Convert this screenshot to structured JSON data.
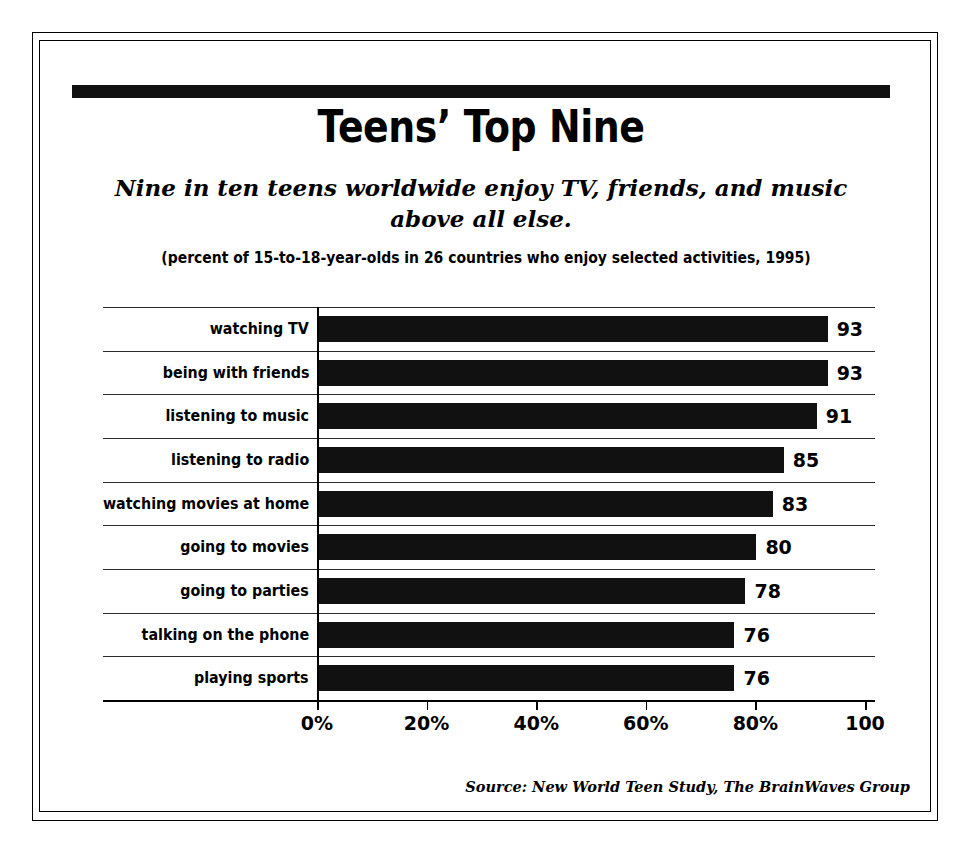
{
  "figure": {
    "title": "Teens’ Top Nine",
    "subtitle": "Nine in ten teens worldwide enjoy TV, friends, and music above all else.",
    "units_note": "(percent of 15-to-18-year-olds in 26 countries who enjoy selected activities, 1995)",
    "source": "Source: New World Teen Study, The BrainWaves Group"
  },
  "chart_data": {
    "type": "bar",
    "orientation": "horizontal",
    "title": "Teens’ Top Nine",
    "subtitle": "Nine in ten teens worldwide enjoy TV, friends, and music above all else.",
    "annotation": "(percent of 15-to-18-year-olds in 26 countries who enjoy selected activities, 1995)",
    "source": "Source: New World Teen Study, The BrainWaves Group",
    "categories": [
      "watching TV",
      "being with friends",
      "listening to music",
      "listening to radio",
      "watching movies at home",
      "going to movies",
      "going to parties",
      "talking on the phone",
      "playing sports"
    ],
    "values": [
      93,
      93,
      91,
      85,
      83,
      80,
      78,
      76,
      76
    ],
    "value_labels": [
      "93",
      "93",
      "91",
      "85",
      "83",
      "80",
      "78",
      "76",
      "76"
    ],
    "xlabel": "",
    "ylabel": "",
    "xlim": [
      0,
      100
    ],
    "xticks": [
      0,
      20,
      40,
      60,
      80,
      100
    ],
    "xtick_labels": [
      "0%",
      "20%",
      "40%",
      "60%",
      "80%",
      "100"
    ],
    "grid": "horizontal",
    "legend": "none",
    "bar_color": "#111111",
    "background_color": "#ffffff"
  }
}
